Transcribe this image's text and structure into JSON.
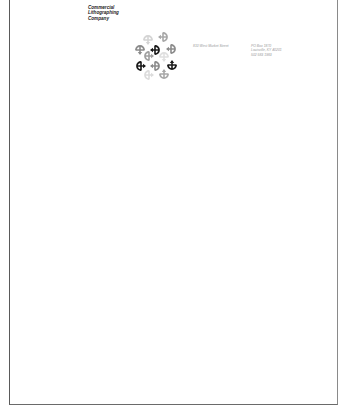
{
  "letterhead": {
    "company_lines": [
      "Commercial",
      "Lithographing",
      "Company"
    ],
    "street": "810 West Market Street",
    "mailing": [
      "PO Box 1870",
      "Louisville, KY 40201",
      "502 583 1983"
    ]
  },
  "logo": {
    "icon": "arrow-rosette-icon",
    "glyphs": [
      {
        "x": 12,
        "y": 4,
        "rot": 0,
        "color": "#d4d4d4"
      },
      {
        "x": 28,
        "y": 2,
        "rot": 90,
        "color": "#a8a8a8"
      },
      {
        "x": 4,
        "y": 14,
        "rot": 0,
        "color": "#8c8c8c"
      },
      {
        "x": 20,
        "y": 15,
        "rot": 90,
        "color": "#1a1a1a"
      },
      {
        "x": 36,
        "y": 14,
        "rot": 90,
        "color": "#8c8c8c"
      },
      {
        "x": 12,
        "y": 21,
        "rot": 270,
        "color": "#a0a0a0"
      },
      {
        "x": 28,
        "y": 21,
        "rot": 0,
        "color": "#e0e0e0"
      },
      {
        "x": 4,
        "y": 31,
        "rot": 270,
        "color": "#1a1a1a"
      },
      {
        "x": 20,
        "y": 31,
        "rot": 90,
        "color": "#8c8c8c"
      },
      {
        "x": 36,
        "y": 31,
        "rot": 180,
        "color": "#1a1a1a"
      },
      {
        "x": 12,
        "y": 40,
        "rot": 270,
        "color": "#dcdcdc"
      },
      {
        "x": 28,
        "y": 40,
        "rot": 180,
        "color": "#a8a8a8"
      }
    ]
  }
}
